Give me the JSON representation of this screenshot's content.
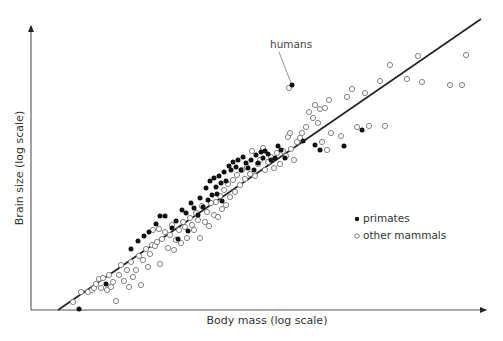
{
  "chart_data": {
    "type": "scatter",
    "title": "",
    "xlabel": "Body mass (log scale)",
    "ylabel": "Brain size (log scale)",
    "axis_ticks": "none",
    "grid": false,
    "legend_position": "right-middle",
    "legend": [
      {
        "name": "primates",
        "marker": "filled-circle",
        "color": "#111111"
      },
      {
        "name": "other mammals",
        "marker": "open-circle",
        "color": "#777777"
      }
    ],
    "annotations": [
      {
        "text": "humans",
        "target_series": "primates",
        "target_point": [
          292,
          85
        ]
      }
    ],
    "regression_line": {
      "x1": 58,
      "y1": 310,
      "x2": 481,
      "y2": 19
    },
    "coordinate_note": "Points are in pixel coordinates of the 503x341 plot (no numeric tick values shown)",
    "series": [
      {
        "name": "primates",
        "points": [
          [
            79,
            309
          ],
          [
            106,
            284
          ],
          [
            131,
            249
          ],
          [
            138,
            241
          ],
          [
            144,
            236
          ],
          [
            149,
            232
          ],
          [
            156,
            224
          ],
          [
            160,
            216
          ],
          [
            165,
            216
          ],
          [
            172,
            228
          ],
          [
            176,
            221
          ],
          [
            178,
            239
          ],
          [
            182,
            210
          ],
          [
            186,
            213
          ],
          [
            188,
            231
          ],
          [
            191,
            203
          ],
          [
            194,
            208
          ],
          [
            198,
            215
          ],
          [
            200,
            198
          ],
          [
            203,
            207
          ],
          [
            206,
            188
          ],
          [
            208,
            200
          ],
          [
            210,
            181
          ],
          [
            212,
            195
          ],
          [
            214,
            178
          ],
          [
            216,
            187
          ],
          [
            217,
            194
          ],
          [
            219,
            176
          ],
          [
            221,
            183
          ],
          [
            222,
            201
          ],
          [
            224,
            172
          ],
          [
            226,
            181
          ],
          [
            229,
            166
          ],
          [
            231,
            170
          ],
          [
            233,
            162
          ],
          [
            236,
            167
          ],
          [
            238,
            160
          ],
          [
            241,
            170
          ],
          [
            243,
            157
          ],
          [
            246,
            163
          ],
          [
            248,
            168
          ],
          [
            251,
            160
          ],
          [
            254,
            170
          ],
          [
            256,
            155
          ],
          [
            258,
            163
          ],
          [
            261,
            152
          ],
          [
            263,
            158
          ],
          [
            265,
            151
          ],
          [
            268,
            154
          ],
          [
            271,
            160
          ],
          [
            275,
            158
          ],
          [
            278,
            146
          ],
          [
            281,
            150
          ],
          [
            285,
            158
          ],
          [
            292,
            85
          ],
          [
            303,
            141
          ],
          [
            315,
            145
          ],
          [
            320,
            150
          ],
          [
            362,
            130
          ],
          [
            344,
            146
          ]
        ]
      },
      {
        "name": "other mammals",
        "points": [
          [
            73,
            302
          ],
          [
            81,
            292
          ],
          [
            88,
            292
          ],
          [
            92,
            290
          ],
          [
            94,
            288
          ],
          [
            96,
            284
          ],
          [
            99,
            279
          ],
          [
            101,
            288
          ],
          [
            103,
            278
          ],
          [
            107,
            290
          ],
          [
            109,
            275
          ],
          [
            111,
            287
          ],
          [
            113,
            282
          ],
          [
            116,
            301
          ],
          [
            119,
            275
          ],
          [
            121,
            265
          ],
          [
            124,
            281
          ],
          [
            127,
            270
          ],
          [
            129,
            287
          ],
          [
            131,
            262
          ],
          [
            133,
            277
          ],
          [
            136,
            270
          ],
          [
            139,
            256
          ],
          [
            141,
            285
          ],
          [
            143,
            260
          ],
          [
            146,
            249
          ],
          [
            148,
            267
          ],
          [
            150,
            254
          ],
          [
            152,
            245
          ],
          [
            153,
            230
          ],
          [
            155,
            246
          ],
          [
            157,
            242
          ],
          [
            159,
            229
          ],
          [
            160,
            264
          ],
          [
            162,
            239
          ],
          [
            165,
            232
          ],
          [
            168,
            248
          ],
          [
            170,
            235
          ],
          [
            172,
            225
          ],
          [
            174,
            250
          ],
          [
            176,
            240
          ],
          [
            179,
            230
          ],
          [
            181,
            243
          ],
          [
            183,
            222
          ],
          [
            185,
            227
          ],
          [
            187,
            238
          ],
          [
            190,
            218
          ],
          [
            192,
            225
          ],
          [
            194,
            230
          ],
          [
            196,
            213
          ],
          [
            198,
            220
          ],
          [
            200,
            238
          ],
          [
            202,
            206
          ],
          [
            205,
            222
          ],
          [
            207,
            212
          ],
          [
            209,
            226
          ],
          [
            211,
            203
          ],
          [
            214,
            215
          ],
          [
            216,
            202
          ],
          [
            218,
            217
          ],
          [
            220,
            196
          ],
          [
            222,
            209
          ],
          [
            224,
            190
          ],
          [
            226,
            205
          ],
          [
            228,
            184
          ],
          [
            230,
            197
          ],
          [
            233,
            180
          ],
          [
            235,
            192
          ],
          [
            237,
            175
          ],
          [
            240,
            185
          ],
          [
            242,
            170
          ],
          [
            245,
            179
          ],
          [
            247,
            167
          ],
          [
            250,
            174
          ],
          [
            252,
            151
          ],
          [
            255,
            176
          ],
          [
            258,
            164
          ],
          [
            260,
            160
          ],
          [
            263,
            148
          ],
          [
            265,
            170
          ],
          [
            268,
            162
          ],
          [
            271,
            157
          ],
          [
            274,
            168
          ],
          [
            277,
            153
          ],
          [
            280,
            164
          ],
          [
            283,
            151
          ],
          [
            286,
            156
          ],
          [
            288,
            137
          ],
          [
            290,
            133
          ],
          [
            291,
            149
          ],
          [
            294,
            160
          ],
          [
            297,
            142
          ],
          [
            300,
            138
          ],
          [
            302,
            133
          ],
          [
            306,
            127
          ],
          [
            309,
            112
          ],
          [
            313,
            118
          ],
          [
            315,
            105
          ],
          [
            318,
            123
          ],
          [
            320,
            109
          ],
          [
            322,
            142
          ],
          [
            325,
            108
          ],
          [
            327,
            150
          ],
          [
            329,
            100
          ],
          [
            331,
            133
          ],
          [
            341,
            136
          ],
          [
            347,
            97
          ],
          [
            352,
            89
          ],
          [
            357,
            127
          ],
          [
            365,
            93
          ],
          [
            369,
            126
          ],
          [
            380,
            81
          ],
          [
            385,
            126
          ],
          [
            390,
            65
          ],
          [
            407,
            79
          ],
          [
            418,
            56
          ],
          [
            422,
            82
          ],
          [
            450,
            85
          ],
          [
            462,
            85
          ],
          [
            466,
            55
          ],
          [
            289,
            88
          ]
        ]
      }
    ]
  },
  "annotation": {
    "label": "humans"
  },
  "legend": {
    "items": [
      {
        "label": "primates"
      },
      {
        "label": "other mammals"
      }
    ]
  },
  "axes": {
    "x_label": "Body mass (log scale)",
    "y_label": "Brain size (log scale)"
  }
}
